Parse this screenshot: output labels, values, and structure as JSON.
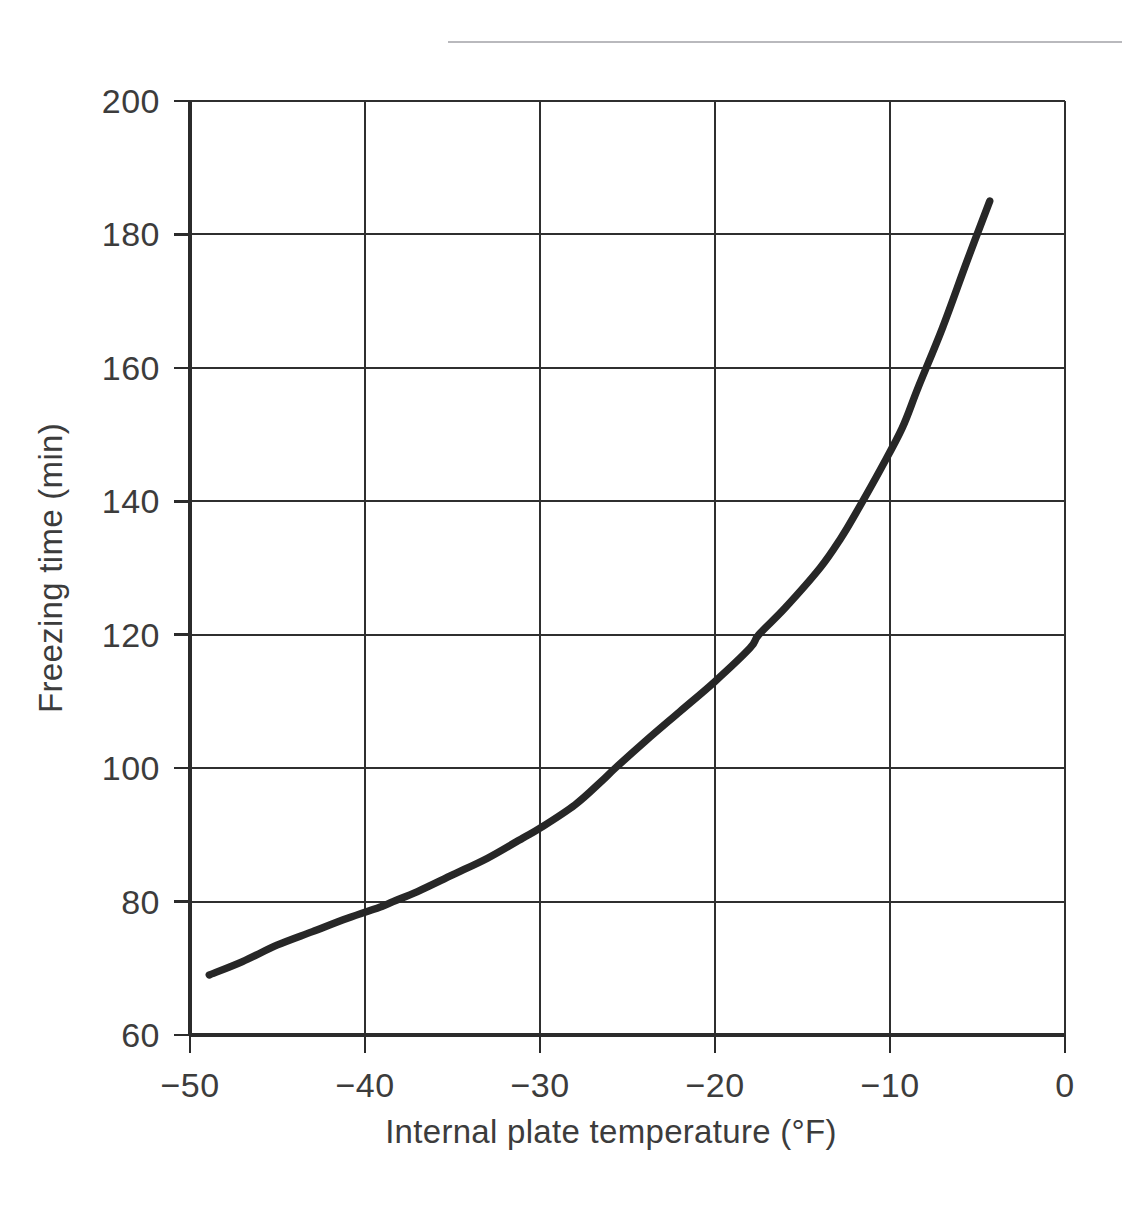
{
  "figure": {
    "top_rule": {
      "visible": true,
      "color": "#b9b9bd"
    },
    "background_color": "#ffffff"
  },
  "chart_data": {
    "type": "line",
    "title": "",
    "xlabel": "Internal plate temperature (°F)",
    "ylabel": "Freezing time (min)",
    "xlim": [
      -50,
      0
    ],
    "ylim": [
      60,
      200
    ],
    "xticks": [
      -50,
      -40,
      -30,
      -20,
      -10,
      0
    ],
    "xticklabels": [
      "−50",
      "−40",
      "−30",
      "−20",
      "−10",
      "0"
    ],
    "yticks": [
      60,
      80,
      100,
      120,
      140,
      160,
      180,
      200
    ],
    "yticklabels": [
      "60",
      "80",
      "100",
      "120",
      "140",
      "160",
      "180",
      "200"
    ],
    "grid": true,
    "grid_color": "#2f2f2f",
    "legend": null,
    "series": [
      {
        "name": "Freezing time",
        "color": "#272727",
        "linewidth": 7.4,
        "x": [
          -48.9,
          -47,
          -45,
          -43,
          -41,
          -39,
          -38.4,
          -37,
          -35,
          -33,
          -31,
          -30,
          -28,
          -26.5,
          -25.7,
          -24,
          -22,
          -20,
          -18,
          -17.5,
          -16,
          -14,
          -12.8,
          -12,
          -10.5,
          -9.3,
          -8.4,
          -7,
          -5.6,
          -4.3
        ],
        "y": [
          69,
          71,
          73.5,
          75.5,
          77.5,
          79.3,
          80,
          81.5,
          84,
          86.5,
          89.5,
          91,
          94.5,
          98,
          100,
          104,
          108.5,
          113,
          118,
          120,
          124,
          130,
          134.5,
          138,
          145,
          151,
          157,
          166,
          176,
          185
        ]
      }
    ]
  },
  "axes": {
    "x_tick_color": "#2b2b2b",
    "y_tick_color": "#2b2b2b"
  }
}
